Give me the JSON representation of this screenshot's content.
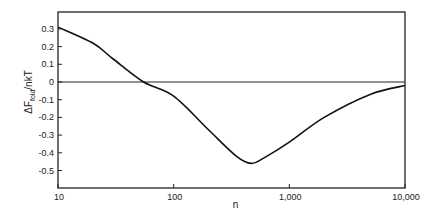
{
  "chart_data": {
    "type": "line",
    "title": "",
    "xlabel": "n",
    "ylabel": "ΔF_fold/nkT",
    "ylabel_parts": {
      "main": "ΔF",
      "sub": "fold",
      "tail": "/nkT"
    },
    "xscale": "log",
    "xlim": [
      10,
      10000
    ],
    "ylim": [
      -0.6,
      0.35
    ],
    "x_ticks": [
      10,
      100,
      1000,
      10000
    ],
    "x_tick_labels": [
      "10",
      "100",
      "1,000",
      "10,000"
    ],
    "y_ticks": [
      0.3,
      0.2,
      0.1,
      0,
      -0.1,
      -0.2,
      -0.3,
      -0.4,
      -0.5
    ],
    "y_tick_labels": [
      "0.3",
      "0.2",
      "0.1",
      "0",
      "-0.1",
      "-0.2",
      "-0.3",
      "-0.4",
      "-0.5"
    ],
    "grid": false,
    "legend": null,
    "reference_line": {
      "y": 0
    },
    "series": [
      {
        "name": "ΔF_fold/nkT",
        "x": [
          10,
          20,
          30,
          55,
          100,
          200,
          350,
          470,
          600,
          1000,
          2000,
          5000,
          10000
        ],
        "values": [
          0.31,
          0.22,
          0.13,
          0.0,
          -0.08,
          -0.27,
          -0.42,
          -0.46,
          -0.43,
          -0.34,
          -0.2,
          -0.07,
          -0.02
        ]
      }
    ]
  }
}
